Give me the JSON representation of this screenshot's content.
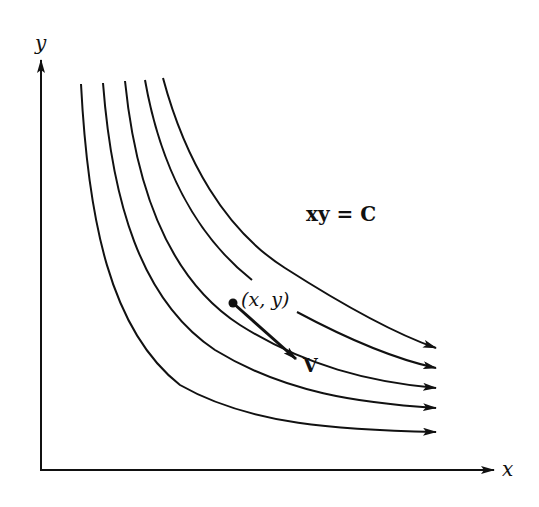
{
  "diagram": {
    "axes": {
      "x_label": "x",
      "y_label": "y"
    },
    "equation_label": "xy = C",
    "point_label": "(x, y)",
    "vector_label": "V",
    "curves": [
      {
        "id": 1,
        "start": [
          81,
          84
        ],
        "end": [
          436,
          432
        ]
      },
      {
        "id": 2,
        "start": [
          103,
          83
        ],
        "end": [
          436,
          408
        ]
      },
      {
        "id": 3,
        "start": [
          125,
          81
        ],
        "end": [
          436,
          388
        ]
      },
      {
        "id": 4,
        "start": [
          145,
          80
        ],
        "end": [
          436,
          368
        ],
        "gap_for_label": true
      },
      {
        "id": 5,
        "start": [
          163,
          78
        ],
        "end": [
          436,
          348
        ]
      }
    ],
    "colors": {
      "ink": "#111111",
      "background": "#ffffff"
    }
  }
}
